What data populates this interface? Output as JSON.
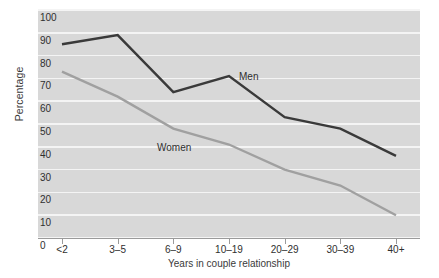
{
  "chart_data": {
    "type": "line",
    "title": "",
    "xlabel": "Years in couple relationship",
    "ylabel": "Percentage",
    "categories": [
      "<2",
      "3–5",
      "6–9",
      "10–19",
      "20–29",
      "30–39",
      "40+"
    ],
    "ylim": [
      0,
      100
    ],
    "yticks": [
      0,
      10,
      20,
      30,
      40,
      50,
      60,
      70,
      80,
      90,
      100
    ],
    "ytick_labels": [
      "0",
      "10",
      "20",
      "30",
      "40",
      "50",
      "60",
      "70",
      "80",
      "90",
      "100"
    ],
    "grid": "horizontal",
    "legend_position": "inline-annotations",
    "series": [
      {
        "name": "Men",
        "color": "#3a3a3a",
        "values": [
          85,
          89,
          64,
          71,
          53,
          48,
          36
        ],
        "label_x_category": "10–19",
        "label_text": "Men"
      },
      {
        "name": "Women",
        "color": "#a0a0a0",
        "values": [
          73,
          62,
          48,
          41,
          30,
          23,
          10
        ],
        "label_x_category": "6–9",
        "label_text": "Women"
      }
    ],
    "annotations": [
      {
        "text": "Men",
        "x_px": 239,
        "y_px": 71
      },
      {
        "text": "Women",
        "x_px": 157,
        "y_px": 142
      }
    ],
    "colors": {
      "plot_background": "#d8d8d8",
      "gridline": "#f4f4f4",
      "page_background": "#ffffff",
      "axis": "#9a9a9a",
      "men_line": "#3a3a3a",
      "women_line": "#a0a0a0",
      "text": "#2f2f2f"
    }
  }
}
